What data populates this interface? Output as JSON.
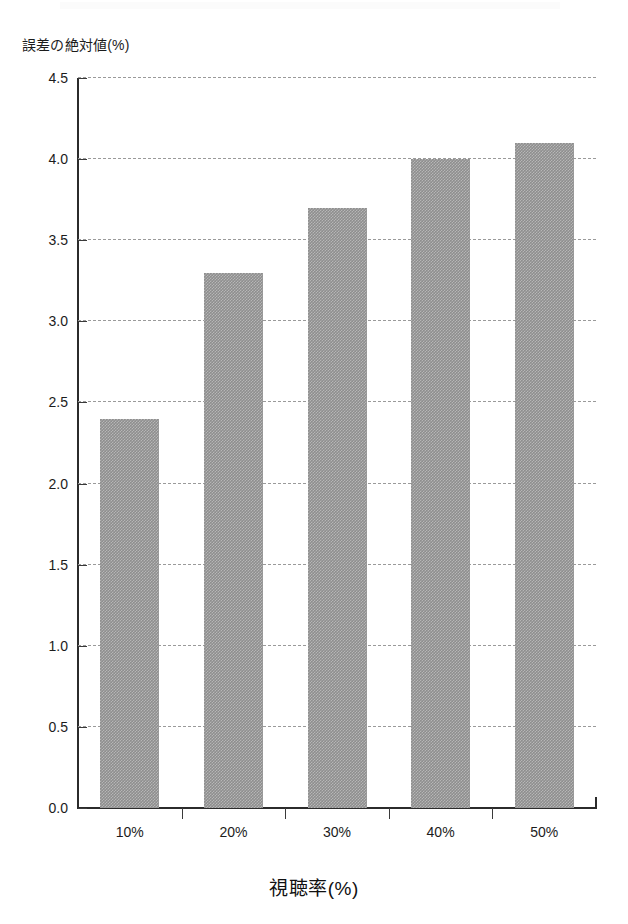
{
  "figure": {
    "name": "absolute-error-vs-viewership-bar-chart",
    "background_color": "#ffffff",
    "bar_color": "#8e8e8e",
    "gridline_color": "#9a9a9a",
    "axis_color": "#2b2b2b"
  },
  "chart_data": {
    "type": "bar",
    "title": "",
    "categories": [
      "10%",
      "20%",
      "30%",
      "40%",
      "50%"
    ],
    "values": [
      2.4,
      3.3,
      3.7,
      4.0,
      4.1
    ],
    "series": [
      {
        "name": "誤差の絶対値(%)",
        "values": [
          2.4,
          3.3,
          3.7,
          4.0,
          4.1
        ]
      }
    ],
    "xlabel": "視聴率(%)",
    "ylabel": "誤差の絶対値(%)",
    "ylim": [
      0.0,
      4.5
    ],
    "ytick_labels": [
      "0.0",
      "0.5",
      "1.0",
      "1.5",
      "2.0",
      "2.5",
      "3.0",
      "3.5",
      "4.0",
      "4.5"
    ],
    "ytick_values": [
      0.0,
      0.5,
      1.0,
      1.5,
      2.0,
      2.5,
      3.0,
      3.5,
      4.0,
      4.5
    ],
    "xtick_labels": [
      "10%",
      "20%",
      "30%",
      "40%",
      "50%"
    ],
    "grid": "horizontal-dashed",
    "legend": "none",
    "legend_position": "none",
    "annotations": []
  }
}
